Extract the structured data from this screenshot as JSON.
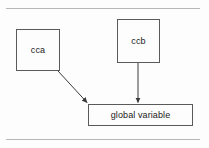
{
  "diagram": {
    "background_color": "#fdfdfd",
    "border_color": "#5a5a5a",
    "rule_color": "#b8b8b8",
    "edge_color": "#3a3a3a",
    "text_color": "#1a1a1a",
    "nodes": [
      {
        "id": "cca",
        "label": "cca",
        "x": 16,
        "y": 29,
        "w": 44,
        "h": 42
      },
      {
        "id": "ccb",
        "label": "ccb",
        "x": 117,
        "y": 19,
        "w": 43,
        "h": 44
      },
      {
        "id": "global",
        "label": "global variable",
        "x": 88,
        "y": 104,
        "w": 105,
        "h": 22
      }
    ],
    "edges": [
      {
        "id": "cca-to-global",
        "from": "cca",
        "to": "global",
        "style": "diagonal-arrow",
        "x1": 58,
        "y1": 71,
        "x2": 88,
        "y2": 103
      },
      {
        "id": "ccb-to-global",
        "from": "ccb",
        "to": "global",
        "style": "vertical-arrow",
        "x1": 138,
        "y1": 63,
        "x2": 138,
        "y2": 103
      }
    ],
    "rules": [
      {
        "id": "top-rule",
        "x": 6,
        "y": 8,
        "w": 194
      },
      {
        "id": "bottom-rule",
        "x": 6,
        "y": 139,
        "w": 194
      }
    ]
  }
}
